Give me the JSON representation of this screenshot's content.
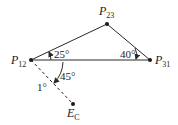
{
  "diagram": {
    "type": "triangle-with-angles",
    "colors": {
      "line": "#2a2a2a",
      "text": "#1a1a1a",
      "background": "#ffffff"
    },
    "points": [
      {
        "id": "P12",
        "main": "P",
        "sub": "12",
        "x": 31,
        "y": 60
      },
      {
        "id": "P23",
        "main": "P",
        "sub": "23",
        "x": 107,
        "y": 24
      },
      {
        "id": "P31",
        "main": "P",
        "sub": "31",
        "x": 150,
        "y": 60
      },
      {
        "id": "EC",
        "main": "E",
        "sub": "C",
        "x": 73,
        "y": 104
      }
    ],
    "edges": [
      {
        "from": "P12",
        "to": "P23",
        "style": "solid"
      },
      {
        "from": "P23",
        "to": "P31",
        "style": "solid"
      },
      {
        "from": "P12",
        "to": "P31",
        "style": "solid"
      },
      {
        "from": "P12",
        "to": "EC",
        "style": "dashed"
      }
    ],
    "angles": [
      {
        "label": "25°",
        "vertex": "P12",
        "between": [
          "P31",
          "P23"
        ]
      },
      {
        "label": "40°",
        "vertex": "P31",
        "between": [
          "P23",
          "P12"
        ]
      },
      {
        "label": "45°",
        "vertex": "P12",
        "between": [
          "P31",
          "EC"
        ]
      },
      {
        "label": "1°",
        "note": "annotation near dashed line"
      }
    ]
  }
}
